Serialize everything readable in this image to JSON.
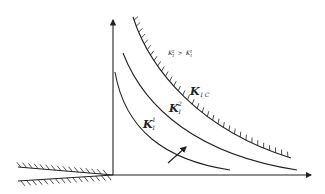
{
  "diagram": {
    "relation_label": {
      "base": "K",
      "sub": "I",
      "sup_left": "2",
      "op": ">",
      "sup_right": "1"
    },
    "critical_curve_label": {
      "base": "K",
      "sub": "I C"
    },
    "curve_2_label": {
      "base": "K",
      "sub": "I",
      "sup": "2"
    },
    "curve_1_label": {
      "base": "K",
      "sub": "I",
      "sup": "1"
    },
    "colors": {
      "ink": "#222222",
      "background": "#ffffff"
    }
  }
}
